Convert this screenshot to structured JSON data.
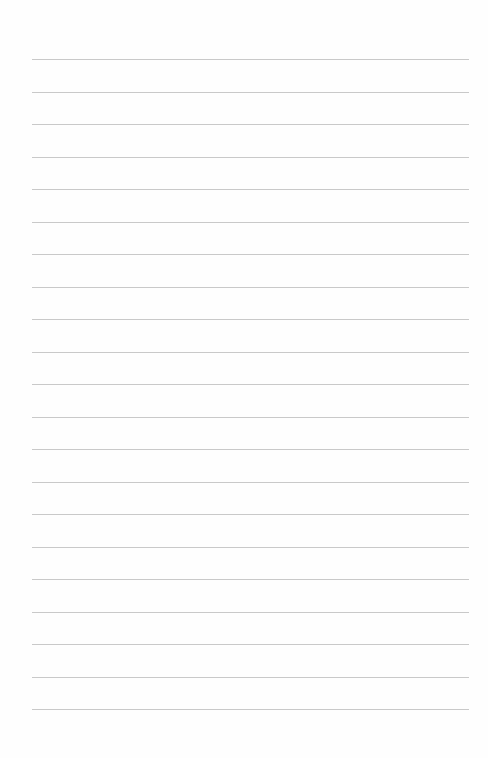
{
  "document": {
    "type": "blank ruled sheet",
    "ruled_line_count": 21,
    "line_color": "#c9c9c9",
    "background_color": "#fefefe",
    "text_content": []
  }
}
